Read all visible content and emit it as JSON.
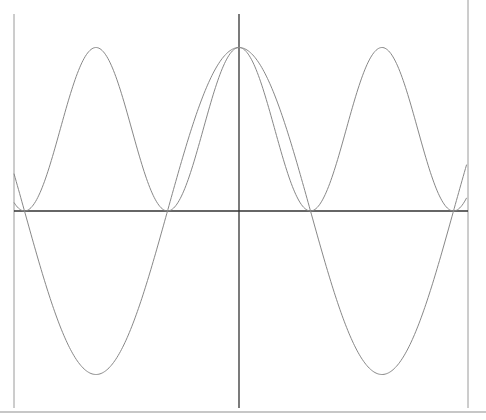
{
  "chart_data": {
    "type": "line",
    "title": "",
    "xlabel": "",
    "ylabel": "",
    "xlim": [
      -5,
      5
    ],
    "ylim": [
      -1,
      1
    ],
    "grid": false,
    "legend": null,
    "series": [
      {
        "name": "cos(x)",
        "color": "#888888",
        "x": [
          -5,
          -4.5,
          -4,
          -3.5,
          -3,
          -2.5,
          -2,
          -1.5,
          -1,
          -0.5,
          0,
          0.5,
          1,
          1.5,
          2,
          2.5,
          3,
          3.5,
          4,
          4.5,
          5
        ],
        "values": [
          0.284,
          -0.211,
          -0.654,
          -0.936,
          -0.99,
          -0.801,
          -0.416,
          0.071,
          0.54,
          0.878,
          1.0,
          0.878,
          0.54,
          0.071,
          -0.416,
          -0.801,
          -0.99,
          -0.936,
          -0.654,
          -0.211,
          0.284
        ]
      },
      {
        "name": "cos^2(x)",
        "color": "#888888",
        "x": [
          -5,
          -4.5,
          -4,
          -3.5,
          -3,
          -2.5,
          -2,
          -1.5,
          -1,
          -0.5,
          0,
          0.5,
          1,
          1.5,
          2,
          2.5,
          3,
          3.5,
          4,
          4.5,
          5
        ],
        "values": [
          0.08,
          0.045,
          0.427,
          0.877,
          0.98,
          0.642,
          0.173,
          0.005,
          0.292,
          0.77,
          1.0,
          0.77,
          0.292,
          0.005,
          0.173,
          0.642,
          0.98,
          0.877,
          0.427,
          0.045,
          0.08
        ]
      }
    ],
    "axes": {
      "x_axis_color": "#333333",
      "y_axis_color": "#222222",
      "frame_color": "#aaaaaa"
    }
  }
}
